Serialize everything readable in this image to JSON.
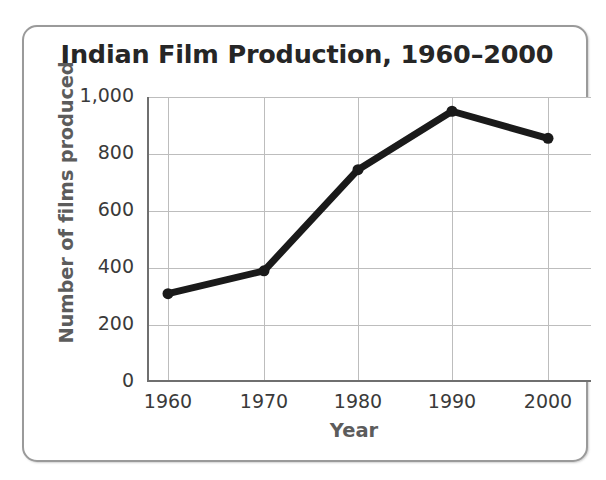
{
  "figure": {
    "background_color": "#ffffff",
    "card_border_color": "#9a9a9a"
  },
  "chart_data": {
    "type": "line",
    "title": "Indian Film Production, 1960–2000",
    "xlabel": "Year",
    "ylabel": "Number of films produced",
    "x": [
      1960,
      1970,
      1980,
      1990,
      2000
    ],
    "categories": [
      "1960",
      "1970",
      "1980",
      "1990",
      "2000"
    ],
    "values": [
      310,
      390,
      745,
      950,
      855
    ],
    "series": [
      {
        "name": "Number of films produced",
        "values": [
          310,
          390,
          745,
          950,
          855
        ],
        "color": "#1a1a1a",
        "line_width_px": 7,
        "marker": "circle",
        "marker_size_px": 11
      }
    ],
    "xlim": [
      1955,
      2005
    ],
    "ylim": [
      0,
      1000
    ],
    "xticks": [
      "1960",
      "1970",
      "1980",
      "1990",
      "2000"
    ],
    "yticks": [
      "0",
      "200",
      "400",
      "600",
      "800",
      "1,000"
    ],
    "ytick_values": [
      0,
      200,
      400,
      600,
      800,
      1000
    ],
    "grid": true,
    "grid_color": "#bdbdbd",
    "legend": false,
    "legend_position": "none",
    "axis_color": "#6f6f6f",
    "title_color": "#262626",
    "axis_label_color": "#5c5c5c",
    "tick_label_color": "#3a3a3a"
  }
}
